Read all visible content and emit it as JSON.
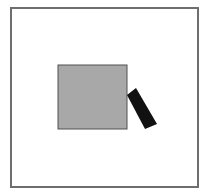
{
  "diagram": {
    "canvas": {
      "width": 208,
      "height": 189,
      "background": "#ffffff"
    },
    "frame": {
      "shape": "rectangle",
      "x": 11,
      "y": 8,
      "width": 187,
      "height": 179,
      "fill": "#ffffff",
      "stroke": "#6e6e6e",
      "stroke_width": 2
    },
    "square": {
      "shape": "rectangle",
      "x": 58,
      "y": 65,
      "width": 69,
      "height": 64,
      "fill": "#a8a8a8",
      "stroke": "#505050",
      "stroke_width": 1
    },
    "bar": {
      "shape": "rotated-rectangle",
      "points": "127,95 136,88 157,124 145,129",
      "fill": "#111111"
    }
  }
}
